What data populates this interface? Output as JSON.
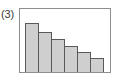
{
  "figure": {
    "label": "(3)",
    "label_icon_name": "figure-number-label"
  },
  "colors": {
    "bar_fill": "#cfcfcf",
    "bar_outline": "#595959",
    "frame_border": "#8e8e8e",
    "background": "#ffffff",
    "label_text": "#3a3a3a"
  },
  "chart_data": {
    "type": "bar",
    "title": "(3)",
    "subtitle": "",
    "xlabel": "",
    "ylabel": "",
    "grid": false,
    "legend": null,
    "axis_ticks_visible": false,
    "categories": [
      "1",
      "2",
      "3",
      "4",
      "5",
      "6"
    ],
    "values": [
      78,
      64,
      52,
      41,
      31,
      22
    ],
    "ylim": [
      0,
      100
    ],
    "bar_count": 6,
    "bar_gap": 0,
    "orientation": "vertical",
    "annotations": []
  },
  "bars": [
    {
      "name": "bar-1",
      "category": "1",
      "value": 78,
      "height_pct": "78%",
      "width_px": "14px"
    },
    {
      "name": "bar-2",
      "category": "2",
      "value": 64,
      "height_pct": "64%",
      "width_px": "14px"
    },
    {
      "name": "bar-3",
      "category": "3",
      "value": 52,
      "height_pct": "52%",
      "width_px": "14px"
    },
    {
      "name": "bar-4",
      "category": "4",
      "value": 41,
      "height_pct": "41%",
      "width_px": "14px"
    },
    {
      "name": "bar-5",
      "category": "5",
      "value": 31,
      "height_pct": "31%",
      "width_px": "14px"
    },
    {
      "name": "bar-6",
      "category": "6",
      "value": 22,
      "height_pct": "22%",
      "width_px": "14px"
    }
  ]
}
